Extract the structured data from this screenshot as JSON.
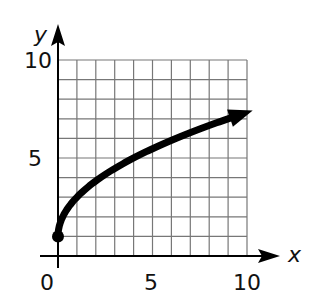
{
  "chart_data": {
    "type": "line",
    "title": "",
    "xlabel": "x",
    "ylabel": "y",
    "xlim": [
      0,
      10
    ],
    "ylim": [
      0,
      10
    ],
    "x_ticks": [
      "0",
      "5",
      "10"
    ],
    "y_ticks": [
      "5",
      "10"
    ],
    "grid": true,
    "grid_step": 1,
    "series": [
      {
        "name": "y = 2√x + 1",
        "x": [
          0,
          0.25,
          1,
          2,
          3,
          4,
          5,
          6,
          7,
          8,
          9,
          10
        ],
        "y": [
          1,
          2,
          3,
          3.83,
          4.46,
          5,
          5.47,
          5.9,
          6.29,
          6.66,
          7,
          7.3
        ],
        "start_point": {
          "x": 0,
          "y": 1,
          "marker": "closed-dot"
        },
        "end": "arrow"
      }
    ]
  },
  "labels": {
    "x_axis": "x",
    "y_axis": "y",
    "origin": "0",
    "x_mid": "5",
    "x_max": "10",
    "y_mid": "5",
    "y_max": "10"
  }
}
